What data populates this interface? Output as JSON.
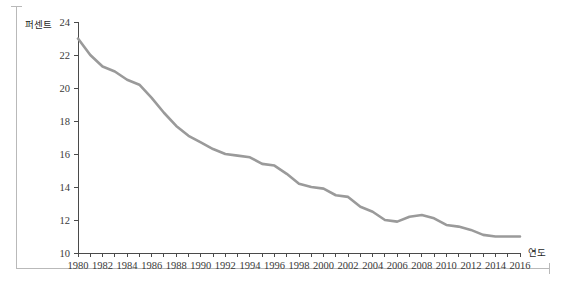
{
  "chart_data": {
    "type": "line",
    "title": "",
    "xlabel": "연도",
    "ylabel": "퍼센트",
    "xlim": [
      1980,
      2016
    ],
    "ylim": [
      10,
      24
    ],
    "grid": false,
    "legend": null,
    "line_color": "#9a9a9a",
    "axis_color": "#4a4a4a",
    "y_ticks": [
      10,
      12,
      14,
      16,
      18,
      20,
      22,
      24
    ],
    "y_tick_labels": [
      "10",
      "12",
      "14",
      "16",
      "18",
      "20",
      "22",
      "24"
    ],
    "x_ticks": [
      1980,
      1981,
      1982,
      1983,
      1984,
      1985,
      1986,
      1987,
      1988,
      1989,
      1990,
      1991,
      1992,
      1993,
      1994,
      1995,
      1996,
      1997,
      1998,
      1999,
      2000,
      2001,
      2002,
      2003,
      2004,
      2005,
      2006,
      2007,
      2008,
      2009,
      2010,
      2011,
      2012,
      2013,
      2014,
      2015,
      2016
    ],
    "x_tick_labels_shown": [
      "1980",
      "1982",
      "1984",
      "1986",
      "1988",
      "1990",
      "1992",
      "1994",
      "1996",
      "1998",
      "2000",
      "2002",
      "2004",
      "2006",
      "2008",
      "2010",
      "2012",
      "2014",
      "2016"
    ],
    "x": [
      1980,
      1981,
      1982,
      1983,
      1984,
      1985,
      1986,
      1987,
      1988,
      1989,
      1990,
      1991,
      1992,
      1993,
      1994,
      1995,
      1996,
      1997,
      1998,
      1999,
      2000,
      2001,
      2002,
      2003,
      2004,
      2005,
      2006,
      2007,
      2008,
      2009,
      2010,
      2011,
      2012,
      2013,
      2014,
      2015,
      2016
    ],
    "values": [
      23.0,
      22.0,
      21.3,
      21.0,
      20.5,
      20.2,
      19.4,
      18.5,
      17.7,
      17.1,
      16.7,
      16.3,
      16.0,
      15.9,
      15.8,
      15.4,
      15.3,
      14.8,
      14.2,
      14.0,
      13.9,
      13.5,
      13.4,
      12.8,
      12.5,
      12.0,
      11.9,
      12.2,
      12.3,
      12.1,
      11.7,
      11.6,
      11.4,
      11.1,
      11.0,
      11.0,
      11.0
    ]
  },
  "axis_labels": {
    "y_title": "퍼센트",
    "x_title": "연도"
  }
}
